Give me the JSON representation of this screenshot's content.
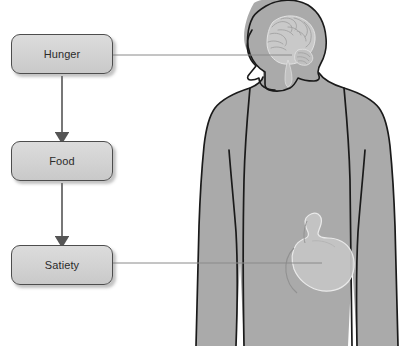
{
  "diagram": {
    "type": "flowchart-with-anatomical-figure",
    "boxes": [
      {
        "id": "hunger",
        "label": "Hunger",
        "x": 11,
        "y": 34,
        "w": 102,
        "h": 40
      },
      {
        "id": "food",
        "label": "Food",
        "x": 11,
        "y": 141,
        "w": 102,
        "h": 40
      },
      {
        "id": "satiety",
        "label": "Satiety",
        "x": 11,
        "y": 245,
        "w": 102,
        "h": 40
      }
    ],
    "arrows": [
      {
        "from": "hunger",
        "to": "food",
        "direction": "down"
      },
      {
        "from": "food",
        "to": "satiety",
        "direction": "down"
      }
    ],
    "leader_lines": [
      {
        "from": "hunger",
        "to": "brain",
        "y": 55
      },
      {
        "from": "satiety",
        "to": "stomach",
        "y": 263
      }
    ],
    "figure": {
      "description": "human torso silhouette, head in left profile",
      "organs": [
        {
          "name": "brain",
          "label": "brain"
        },
        {
          "name": "stomach",
          "label": "stomach"
        }
      ]
    },
    "colors": {
      "box_fill": "#d4d4d4",
      "box_border": "#4d4d4d",
      "box_text": "#2b2b2b",
      "body_fill": "#aaaaaa",
      "body_outline": "#1a1a1a",
      "organ_fill": "#c8c8c8",
      "arrow": "#555555",
      "leader_line": "#8a8a8a",
      "background": "#ffffff"
    }
  }
}
